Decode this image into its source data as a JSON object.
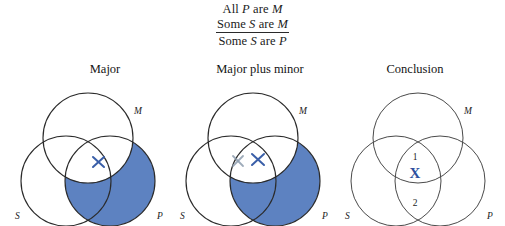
{
  "syllogism": {
    "premise1": {
      "quantifier": "All",
      "subject": "P",
      "copula": "are",
      "predicate": "M"
    },
    "premise2": {
      "quantifier": "Some",
      "subject": "S",
      "copula": "are",
      "predicate": "M"
    },
    "conclusion": {
      "quantifier": "Some",
      "subject": "S",
      "copula": "are",
      "predicate": "P"
    }
  },
  "captions": {
    "major": "Major",
    "major_plus_minor": "Major plus minor",
    "conclusion": "Conclusion"
  },
  "labels": {
    "m": "M",
    "s": "S",
    "p": "P"
  },
  "regions": {
    "one": "1",
    "two": "2"
  },
  "marks": {
    "x_bold": "X"
  },
  "colors": {
    "shade_blue": "#5d82c1",
    "x_blue": "#3a5fa8",
    "x_bold_blue": "#2d4f9e",
    "x_faded_gray": "#8d9cae",
    "circle_stroke": "#2b2b2b",
    "background": "#ffffff"
  }
}
